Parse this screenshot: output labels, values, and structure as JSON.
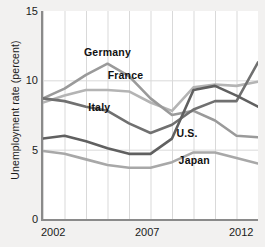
{
  "chart_data": {
    "type": "line",
    "title": "",
    "xlabel": "",
    "ylabel": "Unemployment rate (percent)",
    "xlim": [
      2002,
      2012
    ],
    "ylim": [
      0,
      15
    ],
    "grid": true,
    "legend_position": "inline-labels",
    "x": [
      2002,
      2003,
      2004,
      2005,
      2006,
      2007,
      2008,
      2009,
      2010,
      2011,
      2012
    ],
    "xticks": [
      "2002",
      "2007",
      "2012"
    ],
    "xtick_values": [
      2002,
      2007,
      2012
    ],
    "yticks": [
      "0",
      "5",
      "10",
      "15"
    ],
    "ytick_values": [
      0,
      5,
      10,
      15
    ],
    "series": [
      {
        "name": "Germany",
        "color": "#9a9a9a",
        "values": [
          8.7,
          9.4,
          10.4,
          11.2,
          10.3,
          8.7,
          7.5,
          7.8,
          7.1,
          6.0,
          5.9
        ]
      },
      {
        "name": "France",
        "color": "#b4b4b4",
        "values": [
          8.4,
          8.9,
          9.3,
          9.3,
          9.2,
          8.4,
          7.8,
          9.5,
          9.7,
          9.6,
          9.9
        ]
      },
      {
        "name": "Italy",
        "color": "#707070",
        "values": [
          8.7,
          8.5,
          8.1,
          7.8,
          6.9,
          6.2,
          6.8,
          7.9,
          8.5,
          8.5,
          11.3
        ]
      },
      {
        "name": "U.S.",
        "color": "#606060",
        "values": [
          5.8,
          6.0,
          5.6,
          5.1,
          4.7,
          4.7,
          5.8,
          9.3,
          9.6,
          8.9,
          8.1
        ]
      },
      {
        "name": "Japan",
        "color": "#a8a8a8",
        "values": [
          4.9,
          4.7,
          4.3,
          3.9,
          3.7,
          3.7,
          4.1,
          4.8,
          4.8,
          4.4,
          4.0
        ]
      }
    ],
    "annotations": [
      {
        "text": "Germany",
        "x": 2004.0,
        "y": 12.0
      },
      {
        "text": "France",
        "x": 2005.1,
        "y": 10.3
      },
      {
        "text": "Italy",
        "x": 2004.2,
        "y": 8.0
      },
      {
        "text": "U.S.",
        "x": 2008.3,
        "y": 6.1
      },
      {
        "text": "Japan",
        "x": 2008.4,
        "y": 4.2
      }
    ]
  },
  "colors": {
    "background": "#f2f1f0",
    "plot_background": "#ffffff",
    "axis": "#8a8a8a",
    "grid": "#d9d9d9",
    "text": "#1a1a1a"
  }
}
